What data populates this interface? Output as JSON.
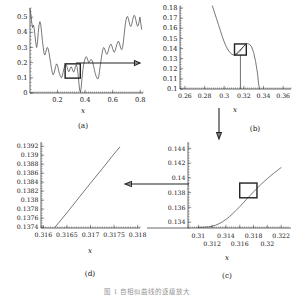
{
  "figure": {
    "caption": "图 1  自相似曲线的逐级放大",
    "panel_labels": {
      "a": "(a)",
      "b": "(b)",
      "c": "(c)",
      "d": "(d)"
    },
    "axis_label_x": "x"
  },
  "chart_data": [
    {
      "type": "line",
      "panel": "a",
      "title": "",
      "xlabel": "x",
      "ylabel": "",
      "xlim": [
        0.0,
        0.82
      ],
      "ylim": [
        0.0,
        0.56
      ],
      "xticks": [
        0.2,
        0.4,
        0.6,
        0.8
      ],
      "xticklabels": [
        "0.2",
        "0.4",
        "0.6",
        "0.8"
      ],
      "yticks": [
        0,
        0.1,
        0.2,
        0.3,
        0.4,
        0.5
      ],
      "yticklabels": [
        "0",
        "0.1",
        "0.2",
        "0.3",
        "0.4",
        "0.5"
      ],
      "grid": false,
      "zoom_box": {
        "x0": 0.255,
        "x1": 0.365,
        "y0": 0.098,
        "y1": 0.192
      },
      "annotation_arrow": "right",
      "x": [
        0.0,
        0.006,
        0.012,
        0.018,
        0.024,
        0.03,
        0.036,
        0.042,
        0.048,
        0.054,
        0.06,
        0.066,
        0.072,
        0.078,
        0.084,
        0.09,
        0.096,
        0.102,
        0.108,
        0.114,
        0.12,
        0.126,
        0.132,
        0.138,
        0.144,
        0.15,
        0.156,
        0.162,
        0.168,
        0.174,
        0.18,
        0.186,
        0.192,
        0.198,
        0.204,
        0.21,
        0.216,
        0.222,
        0.228,
        0.234,
        0.24,
        0.246,
        0.252,
        0.258,
        0.264,
        0.27,
        0.276,
        0.282,
        0.288,
        0.294,
        0.3,
        0.306,
        0.312,
        0.318,
        0.324,
        0.33,
        0.336,
        0.342,
        0.348,
        0.354,
        0.36,
        0.366,
        0.372,
        0.378,
        0.384,
        0.39,
        0.396,
        0.402,
        0.408,
        0.414,
        0.42,
        0.426,
        0.432,
        0.438,
        0.444,
        0.45,
        0.456,
        0.462,
        0.468,
        0.474,
        0.48,
        0.486,
        0.492,
        0.498,
        0.504,
        0.51,
        0.516,
        0.522,
        0.528,
        0.534,
        0.54,
        0.546,
        0.552,
        0.558,
        0.564,
        0.57,
        0.576,
        0.582,
        0.588,
        0.594,
        0.6,
        0.606,
        0.612,
        0.618,
        0.624,
        0.63,
        0.636,
        0.642,
        0.648,
        0.654,
        0.66,
        0.666,
        0.672,
        0.678,
        0.684,
        0.69,
        0.696,
        0.702,
        0.708,
        0.714,
        0.72,
        0.726,
        0.732,
        0.738,
        0.744,
        0.75,
        0.756,
        0.762,
        0.768,
        0.774,
        0.78,
        0.786,
        0.792,
        0.798,
        0.804,
        0.81
      ],
      "y": [
        0.555,
        0.52,
        0.47,
        0.43,
        0.448,
        0.43,
        0.38,
        0.33,
        0.3,
        0.33,
        0.4,
        0.45,
        0.47,
        0.45,
        0.4,
        0.345,
        0.3,
        0.26,
        0.25,
        0.268,
        0.29,
        0.3,
        0.29,
        0.265,
        0.23,
        0.195,
        0.16,
        0.135,
        0.12,
        0.13,
        0.15,
        0.175,
        0.192,
        0.185,
        0.165,
        0.14,
        0.12,
        0.108,
        0.1,
        0.112,
        0.135,
        0.16,
        0.178,
        0.19,
        0.186,
        0.168,
        0.15,
        0.14,
        0.152,
        0.168,
        0.172,
        0.16,
        0.142,
        0.138,
        0.152,
        0.175,
        0.186,
        0.17,
        0.13,
        0.075,
        0.02,
        0.005,
        0.04,
        0.105,
        0.155,
        0.19,
        0.215,
        0.232,
        0.24,
        0.232,
        0.215,
        0.2,
        0.205,
        0.215,
        0.222,
        0.215,
        0.198,
        0.175,
        0.15,
        0.128,
        0.11,
        0.098,
        0.092,
        0.105,
        0.14,
        0.18,
        0.22,
        0.255,
        0.285,
        0.3,
        0.295,
        0.278,
        0.262,
        0.255,
        0.265,
        0.285,
        0.305,
        0.318,
        0.322,
        0.31,
        0.292,
        0.275,
        0.268,
        0.28,
        0.3,
        0.32,
        0.335,
        0.342,
        0.33,
        0.31,
        0.292,
        0.285,
        0.3,
        0.34,
        0.39,
        0.44,
        0.478,
        0.5,
        0.505,
        0.49,
        0.465,
        0.445,
        0.438,
        0.452,
        0.478,
        0.5,
        0.512,
        0.505,
        0.482,
        0.455,
        0.44,
        0.445,
        0.47,
        0.5,
        0.46,
        0.42
      ]
    },
    {
      "type": "line",
      "panel": "b",
      "title": "",
      "xlabel": "x",
      "ylabel": "",
      "xlim": [
        0.255,
        0.368
      ],
      "ylim": [
        0.1,
        0.182
      ],
      "xticks": [
        0.26,
        0.28,
        0.3,
        0.32,
        0.34,
        0.36
      ],
      "xticklabels": [
        "0.26",
        "0.28",
        "0.3",
        "0.32",
        "0.34",
        "0.36"
      ],
      "yticks": [
        0.1,
        0.11,
        0.12,
        0.13,
        0.14,
        0.15,
        0.16,
        0.17,
        0.18
      ],
      "yticklabels": [
        "0.1",
        "0.11",
        "0.12",
        "0.13",
        "0.14",
        "0.15",
        "0.16",
        "0.17",
        "0.18"
      ],
      "grid": false,
      "zoom_box": {
        "x0": 0.3105,
        "x1": 0.3225,
        "y0": 0.1335,
        "y1": 0.1445
      },
      "annotation_arrow": "down",
      "x": [
        0.288,
        0.29,
        0.292,
        0.294,
        0.296,
        0.298,
        0.3,
        0.302,
        0.304,
        0.306,
        0.308,
        0.31,
        0.312,
        0.314,
        0.316,
        0.318,
        0.32,
        0.322,
        0.324,
        0.326,
        0.328,
        0.33,
        0.332,
        0.334,
        0.335,
        0.336
      ],
      "y": [
        0.182,
        0.176,
        0.17,
        0.164,
        0.158,
        0.152,
        0.1465,
        0.142,
        0.1385,
        0.1358,
        0.1342,
        0.1336,
        0.134,
        0.1352,
        0.1372,
        0.1398,
        0.1425,
        0.1442,
        0.1448,
        0.144,
        0.1415,
        0.136,
        0.127,
        0.115,
        0.105,
        0.1
      ]
    },
    {
      "type": "line",
      "panel": "c",
      "title": "",
      "xlabel": "x",
      "ylabel": "",
      "xlim": [
        0.3085,
        0.323
      ],
      "ylim": [
        0.1332,
        0.1446
      ],
      "xticks": [
        0.31,
        0.312,
        0.314,
        0.316,
        0.318,
        0.32,
        0.322
      ],
      "xticklabels": [
        "0.31",
        "0.312",
        "0.314",
        "0.316",
        "0.318",
        "0.32",
        "0.322"
      ],
      "xtick_rows": [
        0,
        1,
        0,
        1,
        0,
        1,
        0
      ],
      "yticks": [
        0.134,
        0.136,
        0.138,
        0.14,
        0.142,
        0.144
      ],
      "yticklabels": [
        "0.134",
        "0.136",
        "0.138",
        "0.14",
        "0.142",
        "0.144"
      ],
      "grid": false,
      "zoom_box": {
        "x0": 0.316,
        "x1": 0.3185,
        "y0": 0.1373,
        "y1": 0.1393
      },
      "annotation_arrow": "left",
      "x": [
        0.31,
        0.3105,
        0.311,
        0.3115,
        0.312,
        0.3125,
        0.313,
        0.3135,
        0.314,
        0.3145,
        0.315,
        0.3155,
        0.316,
        0.3165,
        0.317,
        0.3175,
        0.318,
        0.3185,
        0.319,
        0.3195,
        0.32,
        0.3205,
        0.321,
        0.3215,
        0.322
      ],
      "y": [
        0.1333,
        0.1333,
        0.13332,
        0.13336,
        0.13344,
        0.13358,
        0.13378,
        0.13404,
        0.13436,
        0.13474,
        0.13516,
        0.13562,
        0.1361,
        0.1366,
        0.1371,
        0.1376,
        0.1381,
        0.13858,
        0.13904,
        0.13948,
        0.1399,
        0.1403,
        0.14068,
        0.14104,
        0.1414
      ]
    },
    {
      "type": "line",
      "panel": "d",
      "title": "",
      "xlabel": "x",
      "ylabel": "",
      "xlim": [
        0.31595,
        0.31805
      ],
      "ylim": [
        0.13738,
        0.13925
      ],
      "xticks": [
        0.316,
        0.3165,
        0.317,
        0.3175,
        0.318
      ],
      "xticklabels": [
        "0.316",
        "0.3165",
        "0.317",
        "0.3175",
        "0.318"
      ],
      "yticks": [
        0.1374,
        0.1376,
        0.1378,
        0.138,
        0.1382,
        0.1384,
        0.1386,
        0.1388,
        0.139,
        0.1392
      ],
      "yticklabels": [
        "0.1374",
        "0.1376",
        "0.1378",
        "0.138",
        "0.1382",
        "0.1384",
        "0.1386",
        "0.1388",
        "0.139",
        "0.1392"
      ],
      "grid": false,
      "x": [
        0.31625,
        0.3165,
        0.31675,
        0.317,
        0.31725,
        0.3175,
        0.31762
      ],
      "y": [
        0.1374,
        0.13772,
        0.13805,
        0.13838,
        0.1387,
        0.13903,
        0.13918
      ]
    }
  ]
}
